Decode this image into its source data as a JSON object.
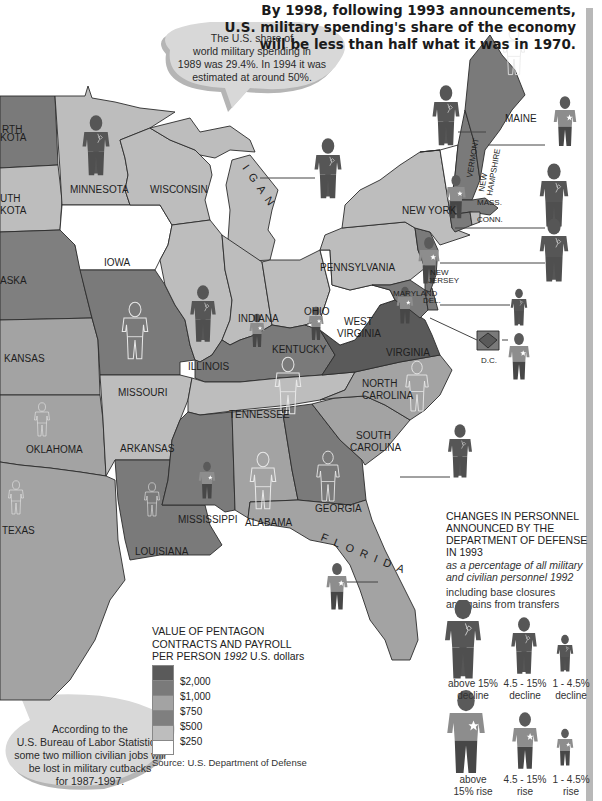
{
  "headline": {
    "lines": [
      "By 1998, following 1993 announcements,",
      "U.S. military spending's share of the economy",
      "will be less than half what it was in 1970."
    ]
  },
  "bubble_top": {
    "lines": [
      "The U.S. share of",
      "world military spending in",
      "1989 was 29.4%. In 1994 it was",
      "estimated at around 50%."
    ]
  },
  "bubble_bottom": {
    "lines": [
      "According to the",
      "U.S. Bureau of Labor Statistics,",
      "some two million civilian jobs will",
      "be lost in military cutbacks",
      "for 1987-1997."
    ]
  },
  "states": {
    "north_dakota": "RTH|KOTA",
    "south_dakota": "UTH|KOTA",
    "nebraska": "ASKA",
    "kansas": "KANSAS",
    "oklahoma": "OKLAHOMA",
    "texas": "TEXAS",
    "minnesota": "MINNESOTA",
    "iowa": "IOWA",
    "missouri": "MISSOURI",
    "arkansas": "ARKANSAS",
    "louisiana": "LOUISIANA",
    "wisconsin": "WISCONSIN",
    "michigan": "MICHIGAN",
    "illinois": "ILLINOIS",
    "indiana": "INDIANA",
    "ohio": "OHIO",
    "kentucky": "KENTUCKY",
    "tennessee": "TENNESSEE",
    "mississippi": "MISSISSIPPI",
    "alabama": "ALABAMA",
    "georgia": "GEORGIA",
    "florida": "FLORIDA",
    "south_carolina": "SOUTH|CAROLINA",
    "north_carolina": "NORTH|CAROLINA",
    "virginia": "VIRGINIA",
    "west_virginia": "WEST|VIRGINIA",
    "maryland": "MARYLAND",
    "delaware": "DEL.",
    "new_jersey": "NEW|JERSEY",
    "pennsylvania": "PENNSYLVANIA",
    "new_york": "NEW YORK",
    "vermont": "VERMONT",
    "new_hampshire": "NEW|HAMPSHIRE",
    "maine": "MAINE",
    "massachusetts": "MASS.",
    "connecticut": "CONN.",
    "rhode_island": "R.I.",
    "dc": "D.C."
  },
  "legend_value": {
    "title_lines": [
      "VALUE OF PENTAGON",
      "CONTRACTS AND PAYROLL"
    ],
    "title_line3_prefix": "PER PERSON ",
    "title_line3_italic": "1992",
    "title_line3_suffix": " U.S. dollars",
    "items": [
      {
        "label": "$2,000",
        "color": "#5a5a5a"
      },
      {
        "label": "$1,000",
        "color": "#7a7a7a"
      },
      {
        "label": "$750",
        "color": "#a3a3a3"
      },
      {
        "label": "$500",
        "color": "#7f7f7f"
      },
      {
        "label": "$250",
        "color": "#bdbdbd"
      },
      {
        "label": "",
        "color": "#ffffff"
      }
    ],
    "source": "Source: U.S. Department of Defense"
  },
  "legend_personnel": {
    "title_lines": [
      "CHANGES IN PERSONNEL",
      "ANNOUNCED BY THE",
      "DEPARTMENT OF DEFENSE",
      "IN 1993"
    ],
    "italic_lines": [
      "as a percentage of all military",
      "and civilian personnel 1992"
    ],
    "note_lines": [
      "including base closures",
      "and gains from transfers"
    ],
    "categories": [
      {
        "label": "above 15%|decline",
        "type": "decline",
        "size": "large"
      },
      {
        "label": "4.5 - 15%|decline",
        "type": "decline",
        "size": "medium"
      },
      {
        "label": "1 - 4.5%|decline",
        "type": "decline",
        "size": "small"
      },
      {
        "label": "above|15% rise",
        "type": "rise",
        "size": "large"
      },
      {
        "label": "4.5 - 15%|rise",
        "type": "rise",
        "size": "medium"
      },
      {
        "label": "1 - 4.5%|rise",
        "type": "rise",
        "size": "small"
      }
    ]
  },
  "colors": {
    "c2000": "#5a5a5a",
    "c1000": "#7a7a7a",
    "c750": "#a3a3a3",
    "c500": "#7f7f7f",
    "c250": "#bdbdbd",
    "c0": "#ffffff",
    "figure_dark": "#555555",
    "figure_rise_top": "#8e8e8e",
    "figure_rise_legs": "#4a4a4a",
    "bubble": "#d4d4d4",
    "bubble_shadow": "#b5b5b5"
  }
}
